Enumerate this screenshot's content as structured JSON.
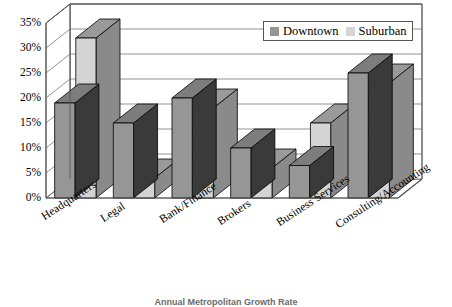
{
  "chart_data": {
    "type": "bar",
    "title": "",
    "caption": "Annual Metropolitan Growth Rate",
    "xlabel": "",
    "ylabel": "",
    "categories": [
      "Headquarters",
      "Legal",
      "Bank/Finance",
      "Brokers",
      "Business Services",
      "Consulting/Accounting"
    ],
    "series": [
      {
        "name": "Downtown",
        "color": "#969696",
        "values": [
          19,
          15,
          20,
          10,
          6.5,
          25
        ]
      },
      {
        "name": "Suburban",
        "color": "#d4d4d4",
        "values": [
          32,
          4,
          18,
          6,
          15,
          23
        ]
      }
    ],
    "ylim": [
      0,
      35
    ],
    "ytick_values": [
      0,
      5,
      10,
      15,
      20,
      25,
      30,
      35
    ],
    "ytick_labels": [
      "0%",
      "5%",
      "10%",
      "15%",
      "20%",
      "25%",
      "30%",
      "35%"
    ],
    "grid": true,
    "grid_axis": "y",
    "legend_position": "top-right",
    "projection": "3d"
  },
  "legend": {
    "entries": [
      {
        "label": "Downtown",
        "swatch": "#969696"
      },
      {
        "label": "Suburban",
        "swatch": "#d4d4d4"
      }
    ]
  },
  "colors": {
    "downtown_face": "#969696",
    "downtown_top": "#7d7d7d",
    "downtown_side": "#3a3a3a",
    "suburban_face": "#d4d4d4",
    "suburban_top": "#9a9a9a",
    "suburban_side": "#8a8a8a",
    "axis_line": "#555555",
    "grid_line": "#777777",
    "floor": "#ffffff",
    "background": "#ffffff",
    "text": "#000000",
    "caption_text": "#6b6b6b"
  }
}
